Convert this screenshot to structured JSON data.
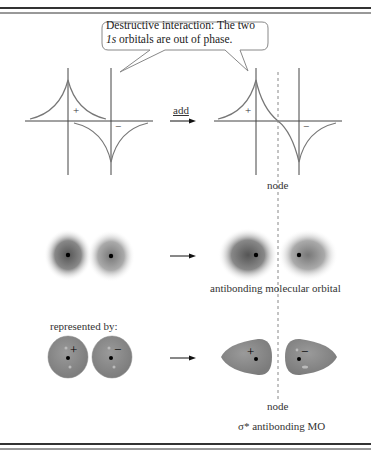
{
  "callout": {
    "line1": "Destructive interaction:  The two",
    "line2_italic": "1s",
    "line2_rest": " orbitals are out of phase."
  },
  "labels": {
    "add": "add",
    "plus": "+",
    "minus": "−",
    "node_top": "node",
    "node_bottom": "node",
    "antibonding_mo": "antibonding molecular orbital",
    "represented_by": "represented by:",
    "sigma_star": "σ* antibonding MO"
  },
  "colors": {
    "curve": "#777777",
    "axis": "#444444",
    "node_line": "#888888",
    "lobe_fill": "#8c8c8c",
    "border": "#333333"
  }
}
